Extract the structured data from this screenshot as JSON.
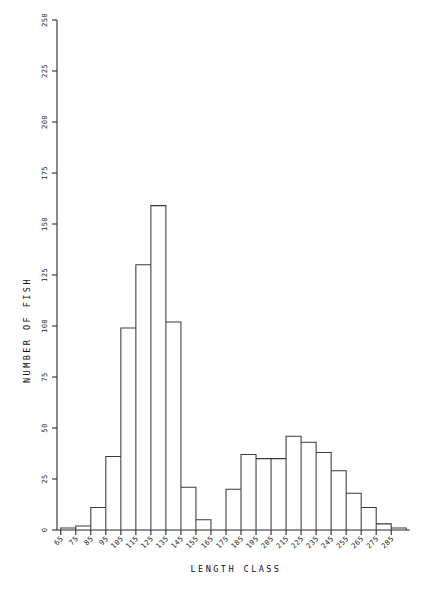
{
  "figure": {
    "background": "#ffffff",
    "ink_color": "#3a3a3a",
    "width": 424,
    "height": 589
  },
  "chart_data": {
    "type": "bar",
    "title": "",
    "subtitle": "",
    "xlabel": "LENGTH CLASS",
    "ylabel": "NUMBER OF FISH",
    "categories": [
      "65",
      "75",
      "85",
      "95",
      "105",
      "115",
      "125",
      "135",
      "145",
      "155",
      "165",
      "175",
      "185",
      "195",
      "205",
      "215",
      "225",
      "235",
      "245",
      "255",
      "265",
      "275",
      "285"
    ],
    "values": [
      1,
      2,
      11,
      36,
      99,
      130,
      159,
      102,
      21,
      5,
      0,
      20,
      37,
      35,
      35,
      46,
      43,
      38,
      29,
      18,
      11,
      3,
      1
    ],
    "xlim": [
      65,
      295
    ],
    "ylim": [
      0,
      250
    ],
    "yticks": [
      0,
      25,
      50,
      75,
      100,
      125,
      150,
      175,
      200,
      225,
      250
    ],
    "ytick_labels": [
      "0",
      "25",
      "50",
      "75",
      "100",
      "125",
      "150",
      "175",
      "200",
      "225",
      "250"
    ],
    "xtick_labels": [
      "65",
      "75",
      "85",
      "95",
      "105",
      "115",
      "125",
      "135",
      "145",
      "155",
      "165",
      "175",
      "185",
      "195",
      "205",
      "215",
      "225",
      "235",
      "245",
      "255",
      "265",
      "275",
      "285"
    ],
    "xtick_rotation": 45,
    "ytick_rotation": 90,
    "grid": false,
    "legend": null,
    "bar_style": "outline",
    "bar_fill": "none",
    "bin_width": 10
  }
}
